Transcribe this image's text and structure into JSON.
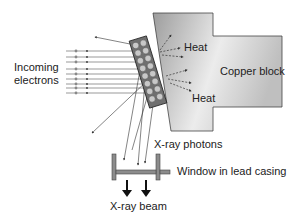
{
  "labels": {
    "incoming_electrons_line1": "Incoming",
    "incoming_electrons_line2": "electrons",
    "heat_top": "Heat",
    "heat_bottom": "Heat",
    "copper_block": "Copper block",
    "xray_photons": "X-ray photons",
    "window": "Window in lead casing",
    "xray_beam": "X-ray beam"
  },
  "colors": {
    "copper_light": "#e6e6e6",
    "copper_dark": "#9a9a9a",
    "target": "#7a7a7a",
    "atom": "#bdbdbd",
    "casing": "#8c8c8c",
    "line": "#333333"
  },
  "electron_count": 9
}
